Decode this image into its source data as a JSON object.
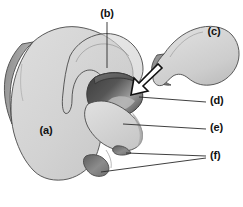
{
  "figure": {
    "type": "grayscale-line-drawing",
    "background_color": "#ffffff",
    "width": 243,
    "height": 207
  },
  "palette": {
    "body_fill_light": "#d4d4d4",
    "body_fill_mid": "#c2c2c2",
    "body_fill_pale": "#dcdcdc",
    "shadow_edge": "#8e8e8e",
    "shadow_dark": "#6b6b6b",
    "cavity_dark": "#4a4a4a",
    "cavity_darkest": "#3b3b3b",
    "cavity_highlight": "#bdbdbd",
    "outline": "#4a4a4a",
    "leader_line": "#2a2a2a",
    "label_text": "#111111",
    "arrow_fill": "#ffffff",
    "arrow_stroke": "#111111"
  },
  "labels": [
    {
      "id": "a",
      "text": "(a)",
      "x": 46,
      "y": 134,
      "anchor": "middle",
      "has_leader": false,
      "description": "main body mass, left lower region"
    },
    {
      "id": "b",
      "text": "(b)",
      "x": 107,
      "y": 17,
      "anchor": "middle",
      "has_leader": true,
      "description": "upper translucent overlapping lobe"
    },
    {
      "id": "c",
      "text": "(c)",
      "x": 214,
      "y": 35,
      "anchor": "middle",
      "has_leader": false,
      "description": "detached kidney-shaped body, upper right"
    },
    {
      "id": "d",
      "text": "(d)",
      "x": 210,
      "y": 104,
      "anchor": "start",
      "has_leader": true,
      "description": "dark concave cavity / groove"
    },
    {
      "id": "e",
      "text": "(e)",
      "x": 210,
      "y": 131,
      "anchor": "start",
      "has_leader": true,
      "description": "rounded condyle surface below cavity"
    },
    {
      "id": "f",
      "text": "(f)",
      "x": 210,
      "y": 159,
      "anchor": "start",
      "has_leader": true,
      "description": "two small notched projections at lower margin"
    }
  ],
  "leader_lines": [
    {
      "name": "leader-b",
      "points": "107,22 107,68"
    },
    {
      "name": "leader-d",
      "points": "206,102 139,97"
    },
    {
      "name": "leader-e",
      "points": "206,129 123,124"
    },
    {
      "name": "leader-f-upper",
      "points": "206,156 126,153"
    },
    {
      "name": "leader-f-lower",
      "points": "206,158 101,172"
    }
  ],
  "arrow": {
    "name": "direction-arrow",
    "description": "outlined block arrow pointing down-left toward the cavity",
    "points": "158,64 139,83 134,78 131,95 148,91 143,86 162,68",
    "fill": "#ffffff",
    "stroke": "#111111"
  },
  "shapes": [
    {
      "name": "main-body",
      "label_ref": "a"
    },
    {
      "name": "upper-lobe",
      "label_ref": "b"
    },
    {
      "name": "detached-body",
      "label_ref": "c"
    },
    {
      "name": "cavity",
      "label_ref": "d"
    },
    {
      "name": "condyle",
      "label_ref": "e"
    },
    {
      "name": "notch-projection-upper",
      "label_ref": "f"
    },
    {
      "name": "notch-projection-lower",
      "label_ref": "f"
    }
  ]
}
